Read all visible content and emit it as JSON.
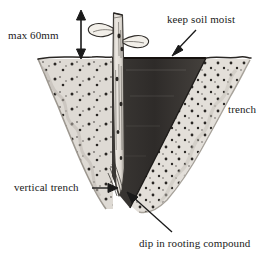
{
  "figure": {
    "background_color": "#ffffff",
    "width": 270,
    "height": 260
  },
  "labels": {
    "max_height": "max 60mm",
    "keep_moist": "keep soil moist",
    "trench": "trench",
    "vertical_trench": "vertical trench",
    "dip_compound": "dip in rooting compound"
  },
  "colors": {
    "ink": "#1a1a1a",
    "soil_light": "#dedad4",
    "soil_light_edge": "#b9b4ad",
    "soil_dark": "#33302e",
    "soil_mid": "#5c5956",
    "stem_light": "#e8e4de",
    "stem_shadow": "#8c8882",
    "speckle": "#2a2724",
    "paper": "#ffffff"
  },
  "annotations": {
    "max_height_arrow": "double-headed-vertical-arrow",
    "keep_moist_arrow": "arrow-down-left",
    "vertical_trench_arrow": "arrow-right",
    "dip_compound_arrow": "arrow-up-left"
  },
  "scene": {
    "ground_line_y": 58,
    "stem_top_y": 12,
    "stem_bottom_y": 196,
    "cutting_leaves": 2,
    "exposed_stem_label": "max 60mm"
  }
}
